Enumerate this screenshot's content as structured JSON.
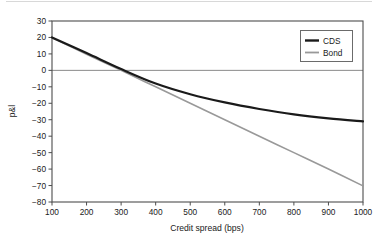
{
  "chart_data": {
    "type": "line",
    "title": "",
    "xlabel": "Credit spread (bps)",
    "ylabel": "p&l",
    "xlim": [
      100,
      1000
    ],
    "ylim": [
      -80,
      30
    ],
    "grid": false,
    "legend_position": "top-right",
    "xticks": [
      100,
      200,
      300,
      400,
      500,
      600,
      700,
      800,
      900,
      1000
    ],
    "yticks": [
      30,
      20,
      10,
      0,
      -10,
      -20,
      -30,
      -40,
      -50,
      -60,
      -70,
      -80
    ],
    "x": [
      100,
      200,
      300,
      400,
      500,
      600,
      700,
      800,
      900,
      1000
    ],
    "series": [
      {
        "name": "CDS",
        "color": "#1a1a1a",
        "width": 2.2,
        "values": [
          20.0,
          10.5,
          0.8,
          -8.0,
          -14.5,
          -19.5,
          -23.5,
          -26.8,
          -29.2,
          -31.0
        ]
      },
      {
        "name": "Bond",
        "color": "#999999",
        "width": 1.6,
        "values": [
          19.8,
          9.8,
          0.0,
          -10.0,
          -20.0,
          -30.0,
          -40.0,
          -50.0,
          -60.0,
          -70.2
        ]
      }
    ],
    "annotations": [
      {
        "name": "zero-line",
        "type": "hline",
        "value": 0,
        "color": "#8a8a8a"
      }
    ]
  },
  "axis": {
    "x_tick_labels": [
      "100",
      "200",
      "300",
      "400",
      "500",
      "600",
      "700",
      "800",
      "900",
      "1000"
    ],
    "y_tick_labels": [
      "30",
      "20",
      "10",
      "0",
      "−10",
      "−20",
      "−30",
      "−40",
      "−50",
      "−60",
      "−70",
      "−80"
    ],
    "x_title": "Credit spread (bps)",
    "y_title": "p&l"
  },
  "legend": {
    "entries": [
      {
        "label": "CDS"
      },
      {
        "label": "Bond"
      }
    ]
  },
  "colors": {
    "cds": "#1a1a1a",
    "bond": "#999999",
    "axis": "#4d4d4d",
    "zero_line": "#8a8a8a",
    "background": "#ffffff"
  }
}
